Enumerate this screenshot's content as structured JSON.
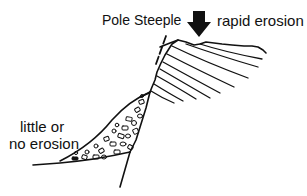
{
  "diagram": {
    "labels": {
      "pole_steeple": "Pole Steeple",
      "rapid_erosion": "rapid erosion",
      "little_or": "little or",
      "no_erosion": "no erosion"
    },
    "elements": {
      "arrow": "down-arrow-icon",
      "cliff": "layered-rock-cliff",
      "pole": "dashed-pole-steeple-line",
      "scree": "scree-talus-wedge"
    },
    "colors": {
      "ink": "#111111",
      "background": "#ffffff"
    }
  }
}
